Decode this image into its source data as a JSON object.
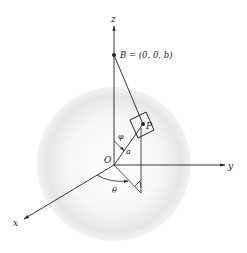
{
  "figure": {
    "axes": {
      "z_label": "z",
      "y_label": "y",
      "x_label": "x"
    },
    "points": {
      "origin_label": "O",
      "b_label": "B = (0, 0, b)",
      "p_label": "P"
    },
    "angles": {
      "phi_label": "φ",
      "theta_label": "θ"
    },
    "segments": {
      "radius_label": "a"
    },
    "colors": {
      "line": "#222222",
      "sphere_fill": "#e4e4e4",
      "background": "#ffffff"
    }
  }
}
